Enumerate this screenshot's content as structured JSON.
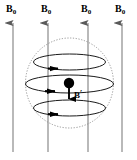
{
  "figure": {
    "background_color": "#ffffff",
    "width": 137,
    "height": 160,
    "external_field": {
      "symbol": "B",
      "subscript": "0",
      "label_text": "B",
      "sub_text": "0",
      "color": "#555555",
      "direction": "up",
      "count": 4,
      "arrows": [
        {
          "name": "field-arrow-1",
          "x": 13,
          "y_top": 21,
          "y_bottom": 152
        },
        {
          "name": "field-arrow-2",
          "x": 48,
          "y_top": 21,
          "y_bottom": 152
        },
        {
          "name": "field-arrow-3",
          "x": 88,
          "y_top": 21,
          "y_bottom": 152
        },
        {
          "name": "field-arrow-4",
          "x": 122,
          "y_top": 21,
          "y_bottom": 152
        }
      ],
      "labels": [
        {
          "name": "field-label-1",
          "x": 6,
          "y": 4
        },
        {
          "name": "field-label-2",
          "x": 41,
          "y": 4
        },
        {
          "name": "field-label-3",
          "x": 81,
          "y": 4
        },
        {
          "name": "field-label-4",
          "x": 115,
          "y": 4
        }
      ]
    },
    "sphere": {
      "name": "dotted-sphere",
      "center_x": 69.5,
      "center_y": 83,
      "radius_x": 44,
      "radius_y": 45,
      "stroke_color": "#8a8a8a",
      "stroke_dasharray": "1.2 1.6",
      "stroke_width": 0.9,
      "fill": "none"
    },
    "current_loops": {
      "stroke_color": "#1a1a1a",
      "stroke_width": 1.0,
      "arrow_color": "#000000",
      "loops": [
        {
          "name": "current-loop-top",
          "cx": 69.5,
          "cy": 62,
          "rx": 36,
          "ry": 8,
          "arrow_x": 56,
          "arrow_y": 68
        },
        {
          "name": "current-loop-middle",
          "cx": 69.5,
          "cy": 84,
          "rx": 44,
          "ry": 9,
          "arrow_x": 53,
          "arrow_y": 91
        },
        {
          "name": "current-loop-bottom",
          "cx": 69.5,
          "cy": 108,
          "rx": 36,
          "ry": 8,
          "arrow_x": 56,
          "arrow_y": 113
        }
      ]
    },
    "nucleus": {
      "name": "nucleus-dot",
      "cx": 69,
      "cy": 83,
      "r": 5.2,
      "color": "#000000"
    },
    "induced_field": {
      "symbol": "B",
      "prime": "′",
      "label_text": "B",
      "prime_text": "′",
      "color": "#000000",
      "direction": "down",
      "arrow": {
        "name": "induced-field-arrow",
        "x": 69,
        "y_top": 88,
        "y_bottom": 101
      },
      "label": {
        "name": "induced-field-label",
        "x": 74,
        "y": 89
      }
    }
  }
}
